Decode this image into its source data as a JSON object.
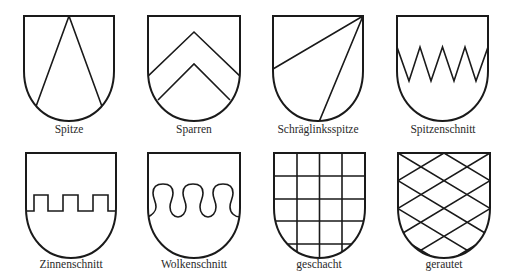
{
  "figure": {
    "type": "heraldic-shield-divisions",
    "items": [
      {
        "label": "Spitze",
        "pattern": "spitze"
      },
      {
        "label": "Sparren",
        "pattern": "sparren"
      },
      {
        "label": "Schräglinksspitze",
        "pattern": "schraeglinksspitze"
      },
      {
        "label": "Spitzenschnitt",
        "pattern": "spitzenschnitt"
      },
      {
        "label": "Zinnenschnitt",
        "pattern": "zinnenschnitt"
      },
      {
        "label": "Wolkenschnitt",
        "pattern": "wolkenschnitt"
      },
      {
        "label": "geschacht",
        "pattern": "geschacht"
      },
      {
        "label": "gerautet",
        "pattern": "gerautet"
      }
    ]
  },
  "colors": {
    "line": "#1a1a1a",
    "background": "#ffffff",
    "label": "#2a2a2a"
  }
}
